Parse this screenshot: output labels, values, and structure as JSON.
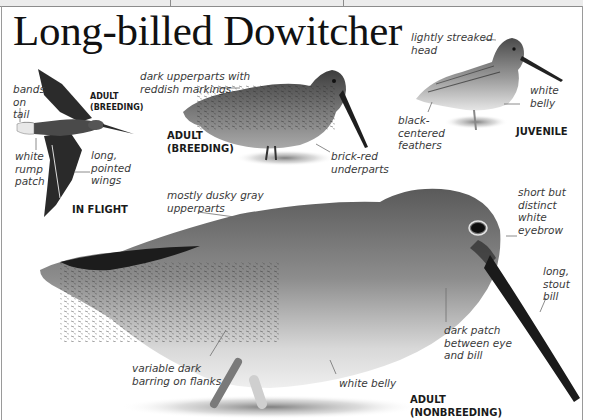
{
  "page": {
    "title": "Long-billed Dowitcher",
    "colors": {
      "background": "#ffffff",
      "title_text": "#111111",
      "annotation_text": "#3a3a3a",
      "label_text": "#1a1a1a",
      "frame": "#9a9a9a"
    }
  },
  "figures": {
    "in_flight": {
      "age_label": "ADULT\n(BREEDING)",
      "view_label": "IN FLIGHT",
      "annotations": [
        {
          "id": "bands-on-tail",
          "text": "bands\non\ntail"
        },
        {
          "id": "white-rump-patch",
          "text": "white\nrump\npatch"
        },
        {
          "id": "long-pointed-wings",
          "text": "long,\npointed\nwings"
        }
      ]
    },
    "adult_breeding": {
      "label": "ADULT\n(BREEDING)",
      "annotations": [
        {
          "id": "dark-upperparts",
          "text": "dark upperparts with\nreddish markings"
        },
        {
          "id": "brick-red-underparts",
          "text": "brick-red\nunderparts"
        }
      ]
    },
    "juvenile": {
      "label": "JUVENILE",
      "annotations": [
        {
          "id": "lightly-streaked-head",
          "text": "lightly streaked\nhead"
        },
        {
          "id": "white-belly-juv",
          "text": "white\nbelly"
        },
        {
          "id": "black-centered-feathers",
          "text": "black-\ncentered\nfeathers"
        }
      ]
    },
    "adult_nonbreeding": {
      "label": "ADULT\n(NONBREEDING)",
      "annotations": [
        {
          "id": "dusky-gray-upperparts",
          "text": "mostly dusky gray\nupperparts"
        },
        {
          "id": "white-eyebrow",
          "text": "short but\ndistinct\nwhite\neyebrow"
        },
        {
          "id": "long-stout-bill",
          "text": "long,\nstout\nbill"
        },
        {
          "id": "dark-patch",
          "text": "dark patch\nbetween eye\nand bill"
        },
        {
          "id": "barring-on-flanks",
          "text": "variable dark\nbarring on flanks"
        },
        {
          "id": "white-belly-adult",
          "text": "white belly"
        }
      ]
    }
  }
}
